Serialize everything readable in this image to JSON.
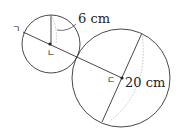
{
  "diagram": {
    "labels": {
      "small_radius": "6 cm",
      "large_diameter": "20 cm",
      "point_a": "ㄱ",
      "point_b": "ㄴ",
      "point_c": "ㄷ"
    },
    "colors": {
      "stroke": "#333333",
      "dashed": "#aaaaaa"
    }
  }
}
